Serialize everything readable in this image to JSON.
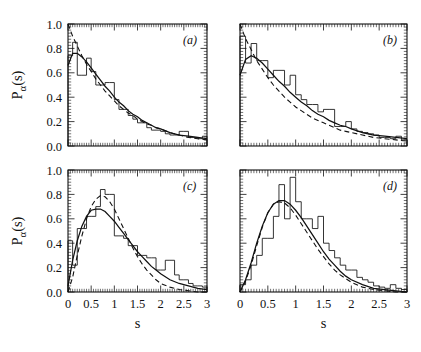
{
  "figure": {
    "axis_titles": {
      "x": "s",
      "y_main": "P",
      "y_sub": "α",
      "y_tail": "(s)"
    },
    "y_ticks": [
      "0.0",
      "0.2",
      "0.4",
      "0.6",
      "0.8",
      "1.0"
    ],
    "x_ticks": [
      "0",
      "0.5",
      "1",
      "1.5",
      "2",
      "2.5",
      "3"
    ]
  },
  "chart_data": [
    {
      "type": "bar",
      "panel": "(a)",
      "title": "",
      "xlabel": "s",
      "ylabel": "P_alpha(s)",
      "xlim": [
        0,
        3
      ],
      "ylim": [
        0,
        1.0
      ],
      "grid": false,
      "legend": "none",
      "bin_width": 0.1,
      "categories": [
        0.05,
        0.15,
        0.25,
        0.35,
        0.45,
        0.55,
        0.65,
        0.75,
        0.85,
        0.95,
        1.05,
        1.15,
        1.25,
        1.35,
        1.45,
        1.55,
        1.65,
        1.75,
        1.85,
        1.95,
        2.05,
        2.15,
        2.25,
        2.35,
        2.45,
        2.55,
        2.65,
        2.75,
        2.85,
        2.95
      ],
      "values": [
        0.74,
        0.85,
        0.58,
        0.58,
        0.72,
        0.61,
        0.5,
        0.5,
        0.52,
        0.52,
        0.38,
        0.3,
        0.3,
        0.25,
        0.22,
        0.19,
        0.19,
        0.15,
        0.13,
        0.13,
        0.12,
        0.1,
        0.09,
        0.09,
        0.12,
        0.12,
        0.07,
        0.07,
        0.06,
        0.08
      ],
      "series": [
        {
          "name": "solid-fit-curve",
          "style": "solid",
          "x": [
            0.0,
            0.1,
            0.2,
            0.3,
            0.4,
            0.5,
            0.6,
            0.7,
            0.8,
            0.9,
            1.0,
            1.1,
            1.2,
            1.3,
            1.4,
            1.5,
            1.6,
            1.7,
            1.8,
            1.9,
            2.0,
            2.2,
            2.4,
            2.6,
            2.8,
            3.0
          ],
          "y": [
            0.66,
            0.76,
            0.76,
            0.73,
            0.69,
            0.64,
            0.59,
            0.54,
            0.49,
            0.45,
            0.4,
            0.36,
            0.33,
            0.29,
            0.26,
            0.24,
            0.21,
            0.19,
            0.17,
            0.15,
            0.14,
            0.11,
            0.09,
            0.08,
            0.07,
            0.06
          ]
        },
        {
          "name": "dashed-reference-curve",
          "style": "dashed",
          "x": [
            0.0,
            0.1,
            0.2,
            0.3,
            0.4,
            0.5,
            0.6,
            0.7,
            0.8,
            0.9,
            1.0,
            1.1,
            1.2,
            1.3,
            1.4,
            1.5,
            1.6,
            1.7,
            1.8,
            1.9,
            2.0,
            2.2,
            2.4,
            2.6,
            2.8,
            3.0
          ],
          "y": [
            1.0,
            0.9,
            0.82,
            0.74,
            0.67,
            0.61,
            0.55,
            0.5,
            0.45,
            0.41,
            0.37,
            0.33,
            0.3,
            0.27,
            0.25,
            0.22,
            0.2,
            0.18,
            0.17,
            0.15,
            0.14,
            0.11,
            0.09,
            0.07,
            0.06,
            0.05
          ]
        }
      ]
    },
    {
      "type": "bar",
      "panel": "(b)",
      "title": "",
      "xlabel": "s",
      "ylabel": "P_alpha(s)",
      "xlim": [
        0,
        3
      ],
      "ylim": [
        0,
        1.0
      ],
      "grid": false,
      "legend": "none",
      "bin_width": 0.1,
      "categories": [
        0.05,
        0.15,
        0.25,
        0.35,
        0.45,
        0.55,
        0.65,
        0.75,
        0.85,
        0.95,
        1.05,
        1.15,
        1.25,
        1.35,
        1.45,
        1.55,
        1.65,
        1.75,
        1.85,
        1.95,
        2.05,
        2.15,
        2.25,
        2.35,
        2.45,
        2.55,
        2.65,
        2.75,
        2.85,
        2.95
      ],
      "values": [
        0.9,
        0.68,
        0.84,
        0.7,
        0.7,
        0.56,
        0.62,
        0.62,
        0.5,
        0.58,
        0.42,
        0.38,
        0.34,
        0.34,
        0.28,
        0.3,
        0.3,
        0.16,
        0.16,
        0.2,
        0.14,
        0.12,
        0.11,
        0.1,
        0.09,
        0.07,
        0.07,
        0.06,
        0.08,
        0.05
      ],
      "series": [
        {
          "name": "solid-fit-curve",
          "style": "solid",
          "x": [
            0.0,
            0.1,
            0.2,
            0.3,
            0.4,
            0.5,
            0.6,
            0.7,
            0.8,
            0.9,
            1.0,
            1.1,
            1.2,
            1.3,
            1.4,
            1.5,
            1.6,
            1.7,
            1.8,
            1.9,
            2.0,
            2.2,
            2.4,
            2.6,
            2.8,
            3.0
          ],
          "y": [
            0.58,
            0.71,
            0.74,
            0.72,
            0.68,
            0.63,
            0.58,
            0.53,
            0.49,
            0.44,
            0.4,
            0.36,
            0.33,
            0.29,
            0.26,
            0.24,
            0.21,
            0.19,
            0.17,
            0.16,
            0.14,
            0.11,
            0.09,
            0.08,
            0.07,
            0.06
          ]
        },
        {
          "name": "dashed-reference-curve",
          "style": "dashed",
          "x": [
            0.0,
            0.1,
            0.2,
            0.3,
            0.4,
            0.5,
            0.6,
            0.7,
            0.8,
            0.9,
            1.0,
            1.1,
            1.2,
            1.3,
            1.4,
            1.5,
            1.6,
            1.7,
            1.8,
            1.9,
            2.0,
            2.2,
            2.4,
            2.6,
            2.8,
            3.0
          ],
          "y": [
            1.0,
            0.88,
            0.79,
            0.7,
            0.63,
            0.56,
            0.5,
            0.45,
            0.4,
            0.36,
            0.32,
            0.29,
            0.26,
            0.23,
            0.21,
            0.19,
            0.17,
            0.15,
            0.13,
            0.12,
            0.11,
            0.09,
            0.07,
            0.06,
            0.05,
            0.04
          ]
        }
      ]
    },
    {
      "type": "bar",
      "panel": "(c)",
      "title": "",
      "xlabel": "s",
      "ylabel": "P_alpha(s)",
      "xlim": [
        0,
        3
      ],
      "ylim": [
        0,
        1.0
      ],
      "grid": false,
      "legend": "none",
      "bin_width": 0.1,
      "categories": [
        0.05,
        0.15,
        0.25,
        0.35,
        0.45,
        0.55,
        0.65,
        0.75,
        0.85,
        0.95,
        1.05,
        1.15,
        1.25,
        1.35,
        1.45,
        1.55,
        1.65,
        1.75,
        1.85,
        1.95,
        2.05,
        2.15,
        2.25,
        2.35,
        2.45,
        2.55,
        2.65,
        2.75,
        2.85,
        2.95
      ],
      "values": [
        0.42,
        0.22,
        0.52,
        0.52,
        0.62,
        0.62,
        0.7,
        0.84,
        0.8,
        0.8,
        0.46,
        0.46,
        0.44,
        0.38,
        0.38,
        0.3,
        0.3,
        0.28,
        0.28,
        0.18,
        0.18,
        0.26,
        0.26,
        0.14,
        0.1,
        0.1,
        0.07,
        0.05,
        0.05,
        0.04
      ],
      "series": [
        {
          "name": "solid-fit-curve",
          "style": "solid",
          "x": [
            0.0,
            0.1,
            0.2,
            0.3,
            0.4,
            0.5,
            0.6,
            0.7,
            0.8,
            0.9,
            1.0,
            1.1,
            1.2,
            1.3,
            1.4,
            1.5,
            1.6,
            1.7,
            1.8,
            1.9,
            2.0,
            2.2,
            2.4,
            2.6,
            2.8,
            3.0
          ],
          "y": [
            0.05,
            0.26,
            0.42,
            0.54,
            0.62,
            0.67,
            0.68,
            0.68,
            0.66,
            0.62,
            0.58,
            0.53,
            0.48,
            0.43,
            0.38,
            0.33,
            0.29,
            0.25,
            0.21,
            0.18,
            0.15,
            0.1,
            0.07,
            0.05,
            0.03,
            0.02
          ]
        },
        {
          "name": "dashed-reference-curve",
          "style": "dashed",
          "x": [
            0.0,
            0.1,
            0.2,
            0.3,
            0.4,
            0.5,
            0.6,
            0.7,
            0.8,
            0.9,
            1.0,
            1.1,
            1.2,
            1.3,
            1.4,
            1.5,
            1.6,
            1.7,
            1.8,
            1.9,
            2.0,
            2.2,
            2.4,
            2.6,
            2.8,
            3.0
          ],
          "y": [
            0.0,
            0.12,
            0.3,
            0.46,
            0.6,
            0.7,
            0.76,
            0.79,
            0.78,
            0.74,
            0.68,
            0.6,
            0.52,
            0.44,
            0.36,
            0.29,
            0.23,
            0.18,
            0.14,
            0.1,
            0.07,
            0.04,
            0.02,
            0.01,
            0.0,
            0.0
          ]
        }
      ]
    },
    {
      "type": "bar",
      "panel": "(d)",
      "title": "",
      "xlabel": "s",
      "ylabel": "P_alpha(s)",
      "xlim": [
        0,
        3
      ],
      "ylim": [
        0,
        1.0
      ],
      "grid": false,
      "legend": "none",
      "bin_width": 0.1,
      "categories": [
        0.05,
        0.15,
        0.25,
        0.35,
        0.45,
        0.55,
        0.65,
        0.75,
        0.85,
        0.95,
        1.05,
        1.15,
        1.25,
        1.35,
        1.45,
        1.55,
        1.65,
        1.75,
        1.85,
        1.95,
        2.05,
        2.15,
        2.25,
        2.35,
        2.45,
        2.55,
        2.65,
        2.75,
        2.85,
        2.95
      ],
      "values": [
        0.06,
        0.1,
        0.22,
        0.3,
        0.44,
        0.44,
        0.62,
        0.88,
        0.6,
        0.94,
        0.74,
        0.6,
        0.6,
        0.52,
        0.62,
        0.4,
        0.34,
        0.28,
        0.22,
        0.18,
        0.18,
        0.12,
        0.1,
        0.08,
        0.05,
        0.04,
        0.03,
        0.06,
        0.03,
        0.02
      ],
      "series": [
        {
          "name": "solid-fit-curve",
          "style": "solid",
          "x": [
            0.0,
            0.1,
            0.2,
            0.3,
            0.4,
            0.5,
            0.6,
            0.7,
            0.8,
            0.9,
            1.0,
            1.1,
            1.2,
            1.3,
            1.4,
            1.5,
            1.6,
            1.7,
            1.8,
            1.9,
            2.0,
            2.2,
            2.4,
            2.6,
            2.8,
            3.0
          ],
          "y": [
            0.0,
            0.1,
            0.24,
            0.4,
            0.54,
            0.65,
            0.72,
            0.75,
            0.75,
            0.72,
            0.67,
            0.61,
            0.54,
            0.47,
            0.4,
            0.33,
            0.27,
            0.22,
            0.17,
            0.13,
            0.1,
            0.06,
            0.03,
            0.02,
            0.01,
            0.0
          ]
        },
        {
          "name": "dashed-reference-curve",
          "style": "dashed",
          "x": [
            0.0,
            0.1,
            0.2,
            0.3,
            0.4,
            0.5,
            0.6,
            0.7,
            0.8,
            0.9,
            1.0,
            1.1,
            1.2,
            1.3,
            1.4,
            1.5,
            1.6,
            1.7,
            1.8,
            1.9,
            2.0,
            2.2,
            2.4,
            2.6,
            2.8,
            3.0
          ],
          "y": [
            0.0,
            0.09,
            0.22,
            0.38,
            0.53,
            0.65,
            0.72,
            0.74,
            0.73,
            0.69,
            0.63,
            0.56,
            0.49,
            0.42,
            0.35,
            0.29,
            0.23,
            0.18,
            0.14,
            0.11,
            0.08,
            0.04,
            0.02,
            0.01,
            0.0,
            0.0
          ]
        }
      ]
    }
  ]
}
